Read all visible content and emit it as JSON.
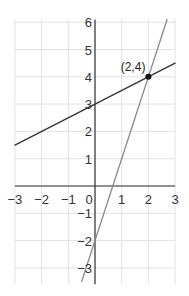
{
  "chart_data": {
    "type": "line",
    "title": "",
    "xlabel": "",
    "ylabel": "",
    "xlim": [
      -3,
      3
    ],
    "ylim": [
      -3.6,
      6.1
    ],
    "grid": true,
    "x_ticks": [
      -3,
      -2,
      -1,
      0,
      1,
      2,
      3
    ],
    "y_ticks": [
      -3,
      -2,
      -1,
      1,
      2,
      3,
      4,
      5,
      6
    ],
    "x_tick_labels": [
      "−3",
      "−2",
      "−1",
      "0",
      "1",
      "2",
      "3"
    ],
    "y_tick_labels": [
      "−3",
      "−2",
      "−1",
      "1",
      "2",
      "3",
      "4",
      "5",
      "6"
    ],
    "series": [
      {
        "name": "line-1",
        "equation": "y = 0.5x + 3",
        "color": "#333333",
        "x": [
          -3,
          3
        ],
        "y": [
          1.5,
          4.5
        ]
      },
      {
        "name": "line-2",
        "equation": "y = 3x − 2",
        "color": "#8a8a8a",
        "x": [
          -0.5,
          2.7
        ],
        "y": [
          -3.5,
          6.1
        ]
      }
    ],
    "annotations": [
      {
        "label": "(2,4)",
        "x": 2,
        "y": 4,
        "marker": "point"
      }
    ]
  }
}
